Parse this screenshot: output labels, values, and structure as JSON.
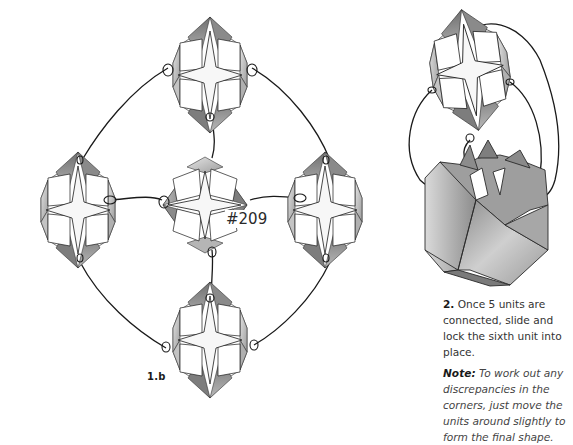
{
  "diagram": {
    "figure_1b": {
      "step_label": "1.b",
      "model_number": "#209",
      "units": [
        {
          "position": "top",
          "cx": 210,
          "cy": 75
        },
        {
          "position": "left",
          "cx": 78,
          "cy": 210
        },
        {
          "position": "center",
          "cx": 205,
          "cy": 205
        },
        {
          "position": "right",
          "cx": 325,
          "cy": 210
        },
        {
          "position": "bottom",
          "cx": 210,
          "cy": 340
        }
      ],
      "connectors": "curved threads linking the five units in a diamond arrangement"
    },
    "figure_2": {
      "description": "sixth unit being slid and locked onto assembled five-unit cube"
    },
    "instructions": {
      "step_number": "2.",
      "step_text": " Once 5 units are connected, slide and lock the sixth unit into place.",
      "note_label": "Note:",
      "note_text": " To work out any discrepancies in the corners, just move the units around slightly to form the final shape."
    },
    "colors": {
      "line": "#1a1a1a",
      "fold_dark": "#7a7a7a",
      "fold_mid": "#a8a8a8",
      "fold_light": "#d8d8d8",
      "paper": "#ffffff"
    }
  }
}
